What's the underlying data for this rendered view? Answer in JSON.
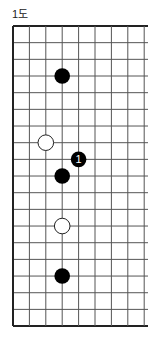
{
  "title": "1도",
  "board": {
    "cols": 9,
    "rows": 19,
    "origin_x": 13,
    "origin_y": 26,
    "spacing_x": 16.4,
    "spacing_y": 16.67,
    "right_extend": 148,
    "line_color": "#555555",
    "border_color": "#222222",
    "stone_radius": 7.8,
    "edges": {
      "top": true,
      "left": true,
      "bottom": true,
      "right": false
    }
  },
  "stones": [
    {
      "color": "black",
      "col": 3,
      "row": 3,
      "label": ""
    },
    {
      "color": "white",
      "col": 2,
      "row": 7,
      "label": ""
    },
    {
      "color": "black",
      "col": 4,
      "row": 8,
      "label": "1"
    },
    {
      "color": "black",
      "col": 3,
      "row": 9,
      "label": ""
    },
    {
      "color": "white",
      "col": 3,
      "row": 12,
      "label": ""
    },
    {
      "color": "black",
      "col": 3,
      "row": 15,
      "label": ""
    }
  ]
}
